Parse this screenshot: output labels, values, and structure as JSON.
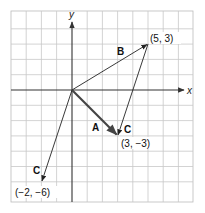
{
  "figure": {
    "type": "vector-diagram",
    "axes": {
      "x_label": "x",
      "y_label": "y"
    },
    "grid": {
      "x_min": -4,
      "x_max": 8,
      "y_min": -7.3,
      "y_max": 5.2,
      "step": 1
    },
    "colors": {
      "grid": "#c8c8c8",
      "axis": "#333333",
      "vector": "#222222",
      "vector_a": "#444444",
      "label": "#111111"
    },
    "vectors": [
      {
        "name": "A",
        "from": [
          0,
          0
        ],
        "to": [
          3,
          -3
        ],
        "thick": true
      },
      {
        "name": "B",
        "from": [
          0,
          0
        ],
        "to": [
          5,
          3
        ],
        "thick": false
      },
      {
        "name": "C",
        "from": [
          5,
          3
        ],
        "to": [
          3,
          -3
        ],
        "thick": false
      },
      {
        "name": "C",
        "from": [
          0,
          0
        ],
        "to": [
          -2,
          -6
        ],
        "thick": false
      }
    ],
    "labels": {
      "vector_a": "A",
      "vector_b": "B",
      "vector_c_upper": "C",
      "vector_c_lower": "C",
      "point_5_3": "(5, 3)",
      "point_3_m3": "(3, −3)",
      "point_m2_m6": "(−2, −6)"
    }
  }
}
